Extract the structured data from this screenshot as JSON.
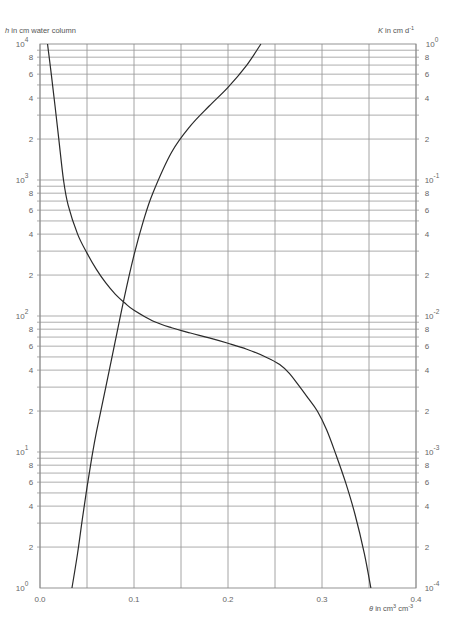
{
  "chart_data": {
    "type": "line",
    "title": "",
    "xlabel": "θ in cm3 cm-3",
    "ylabel_left": "h in cm water column",
    "ylabel_right": "K in cm d-1",
    "x_range": [
      0.0,
      0.4
    ],
    "y_left_range_log10": [
      0,
      4
    ],
    "y_right_range_log10": [
      -4,
      0
    ],
    "y_scale": "log",
    "grid": true,
    "x_ticks": [
      "0.0",
      "0.1",
      "0.2",
      "0.3",
      "0.4"
    ],
    "x_grid": [
      0.0,
      0.05,
      0.1,
      0.15,
      0.2,
      0.25,
      0.3,
      0.35,
      0.4
    ],
    "left_decade_labels": [
      {
        "base": "10",
        "exp": "0",
        "log": 0
      },
      {
        "base": "10",
        "exp": "1",
        "log": 1
      },
      {
        "base": "10",
        "exp": "2",
        "log": 2
      },
      {
        "base": "10",
        "exp": "3",
        "log": 3
      },
      {
        "base": "10",
        "exp": "4",
        "log": 4
      }
    ],
    "right_decade_labels": [
      {
        "base": "10",
        "exp": "-4",
        "log": 0
      },
      {
        "base": "10",
        "exp": "-3",
        "log": 1
      },
      {
        "base": "10",
        "exp": "-2",
        "log": 2
      },
      {
        "base": "10",
        "exp": "-1",
        "log": 3
      },
      {
        "base": "10",
        "exp": "0",
        "log": 4
      }
    ],
    "minor_labels": [
      "2",
      "4",
      "6",
      "8"
    ],
    "series": [
      {
        "name": "h (water retention curve)",
        "axis": "left",
        "theta": [
          0.008,
          0.012,
          0.016,
          0.02,
          0.025,
          0.03,
          0.04,
          0.05,
          0.06,
          0.07,
          0.08,
          0.09,
          0.1,
          0.12,
          0.14,
          0.16,
          0.18,
          0.2,
          0.22,
          0.24,
          0.255,
          0.265,
          0.275,
          0.285,
          0.295,
          0.305,
          0.315,
          0.325,
          0.335,
          0.345,
          0.352
        ],
        "h": [
          10000,
          6000,
          3500,
          2000,
          1000,
          650,
          400,
          290,
          220,
          175,
          145,
          125,
          110,
          92,
          82,
          75,
          69,
          63,
          57,
          50,
          44,
          38,
          31,
          25,
          20,
          14.5,
          9.5,
          6,
          3.5,
          1.8,
          1
        ]
      },
      {
        "name": "K (hydraulic conductivity)",
        "axis": "right",
        "theta": [
          0.034,
          0.04,
          0.045,
          0.05,
          0.055,
          0.06,
          0.07,
          0.08,
          0.09,
          0.1,
          0.11,
          0.12,
          0.14,
          0.16,
          0.18,
          0.2,
          0.22,
          0.235
        ],
        "K": [
          0.0001,
          0.00018,
          0.00032,
          0.00055,
          0.0009,
          0.0014,
          0.003,
          0.0065,
          0.014,
          0.028,
          0.05,
          0.08,
          0.16,
          0.25,
          0.35,
          0.48,
          0.7,
          1.0
        ]
      }
    ]
  }
}
